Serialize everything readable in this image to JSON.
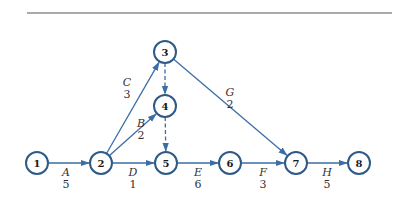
{
  "diagram": {
    "type": "activity-on-arrow network",
    "nodes": [
      {
        "id": "1",
        "label": "1"
      },
      {
        "id": "2",
        "label": "2"
      },
      {
        "id": "3",
        "label": "3"
      },
      {
        "id": "4",
        "label": "4"
      },
      {
        "id": "5",
        "label": "5"
      },
      {
        "id": "6",
        "label": "6"
      },
      {
        "id": "7",
        "label": "7"
      },
      {
        "id": "8",
        "label": "8"
      }
    ],
    "activities": [
      {
        "from": "1",
        "to": "2",
        "name": "A",
        "duration": "5",
        "dummy": false
      },
      {
        "from": "2",
        "to": "3",
        "name": "C",
        "duration": "3",
        "dummy": false
      },
      {
        "from": "2",
        "to": "4",
        "name": "B",
        "duration": "2",
        "dummy": false
      },
      {
        "from": "2",
        "to": "5",
        "name": "D",
        "duration": "1",
        "dummy": false
      },
      {
        "from": "3",
        "to": "4",
        "name": "",
        "duration": "",
        "dummy": true
      },
      {
        "from": "4",
        "to": "5",
        "name": "",
        "duration": "",
        "dummy": true
      },
      {
        "from": "3",
        "to": "7",
        "name": "G",
        "duration": "2",
        "dummy": false
      },
      {
        "from": "5",
        "to": "6",
        "name": "E",
        "duration": "6",
        "dummy": false
      },
      {
        "from": "6",
        "to": "7",
        "name": "F",
        "duration": "3",
        "dummy": false
      },
      {
        "from": "7",
        "to": "8",
        "name": "H",
        "duration": "5",
        "dummy": false
      }
    ]
  }
}
